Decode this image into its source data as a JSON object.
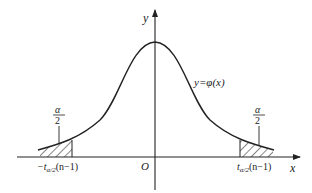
{
  "diagram": {
    "type": "probability-density-curve",
    "axes": {
      "x_label": "x",
      "y_label": "y",
      "origin_label": "O"
    },
    "curve_label": "y=φ(x)",
    "left_tail": {
      "area_numerator": "α",
      "area_denominator": "2",
      "critical_value_prefix": "−t",
      "critical_value_subscript": "α/2",
      "critical_value_suffix": "(n−1)"
    },
    "right_tail": {
      "area_numerator": "α",
      "area_denominator": "2",
      "critical_value_prefix": "t",
      "critical_value_subscript": "α/2",
      "critical_value_suffix": "(n−1)"
    },
    "colors": {
      "line": "#222222",
      "background": "#ffffff"
    }
  }
}
